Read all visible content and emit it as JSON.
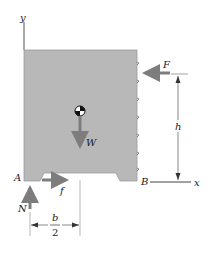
{
  "diagram": {
    "type": "free-body-diagram",
    "axes": {
      "y_label": "y",
      "x_label": "x"
    },
    "points": {
      "A": "A",
      "B": "B"
    },
    "forces": {
      "F": "F",
      "W": "W",
      "N": "N",
      "f": "f"
    },
    "dimensions": {
      "h": "h",
      "b_numerator": "b",
      "b_denominator": "2"
    },
    "colors": {
      "block_fill": "#b8b8b8",
      "arrow": "#7d7d7d",
      "line": "#555555",
      "text": "#1a1a1a"
    }
  }
}
